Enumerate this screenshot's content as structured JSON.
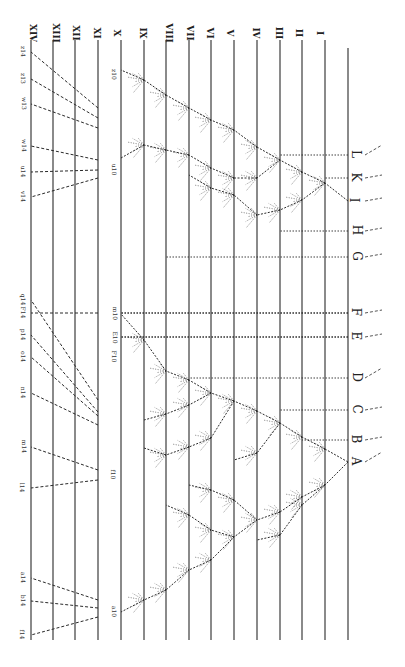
{
  "figure": {
    "ink_color": "#2a2a2a",
    "background": "#ffffff"
  },
  "generations": [
    {
      "label": "XIV",
      "x": 31
    },
    {
      "label": "XIII",
      "x": 53
    },
    {
      "label": "XII",
      "x": 75
    },
    {
      "label": "XI",
      "x": 98
    },
    {
      "label": "X",
      "x": 121
    },
    {
      "label": "IX",
      "x": 144
    },
    {
      "label": "VIII",
      "x": 166
    },
    {
      "label": "VII",
      "x": 189
    },
    {
      "label": "VI",
      "x": 211
    },
    {
      "label": "V",
      "x": 234
    },
    {
      "label": "IV",
      "x": 257
    },
    {
      "label": "III",
      "x": 280
    },
    {
      "label": "II",
      "x": 302
    },
    {
      "label": "I",
      "x": 325
    },
    {
      "label": "",
      "x": 348
    }
  ],
  "generation_line_y": [
    40,
    640
  ],
  "species": [
    {
      "label": "A",
      "y": 462
    },
    {
      "label": "B",
      "y": 440
    },
    {
      "label": "C",
      "y": 410
    },
    {
      "label": "D",
      "y": 378
    },
    {
      "label": "E",
      "y": 337
    },
    {
      "label": "F",
      "y": 313
    },
    {
      "label": "G",
      "y": 257
    },
    {
      "label": "H",
      "y": 231
    },
    {
      "label": "I",
      "y": 201
    },
    {
      "label": "K",
      "y": 178
    },
    {
      "label": "L",
      "y": 155
    }
  ],
  "tips": {
    "top_group": [
      {
        "label": "z14",
        "x": 26,
        "y": 52
      },
      {
        "label": "z13",
        "x": 26,
        "y": 79
      },
      {
        "label": "w13",
        "x": 26,
        "y": 104
      },
      {
        "label": "w14",
        "x": 26,
        "y": 146
      },
      {
        "label": "u14",
        "x": 26,
        "y": 172
      },
      {
        "label": "v14",
        "x": 26,
        "y": 197
      }
    ],
    "top_mid": [
      {
        "label": "z10",
        "x": 117,
        "y": 75
      },
      {
        "label": "u10",
        "x": 117,
        "y": 170
      },
      {
        "label": "F14",
        "x": 26,
        "y": 313
      }
    ],
    "a_group": [
      {
        "label": "q14",
        "x": 26,
        "y": 300
      },
      {
        "label": "p14",
        "x": 26,
        "y": 335
      },
      {
        "label": "o14",
        "x": 26,
        "y": 357
      },
      {
        "label": "n14",
        "x": 26,
        "y": 393
      },
      {
        "label": "m14",
        "x": 26,
        "y": 447
      },
      {
        "label": "l14",
        "x": 26,
        "y": 488
      },
      {
        "label": "a14",
        "x": 26,
        "y": 578
      },
      {
        "label": "b14",
        "x": 26,
        "y": 601
      },
      {
        "label": "f14",
        "x": 26,
        "y": 635
      }
    ],
    "a_mid": [
      {
        "label": "m10",
        "x": 117,
        "y": 314
      },
      {
        "label": "E10",
        "x": 117,
        "y": 338
      },
      {
        "label": "F10",
        "x": 117,
        "y": 357
      },
      {
        "label": "a10",
        "x": 117,
        "y": 612
      },
      {
        "label": "f10",
        "x": 117,
        "y": 475
      }
    ]
  }
}
